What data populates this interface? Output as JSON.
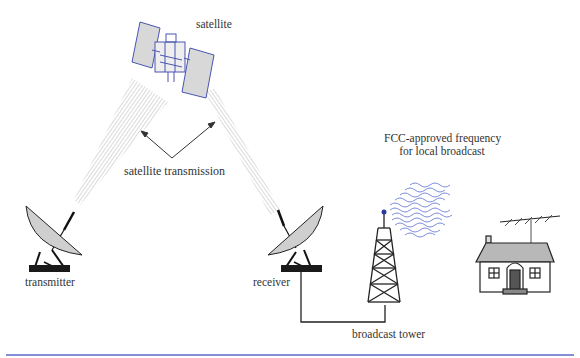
{
  "diagram": {
    "labels": {
      "satellite": "satellite",
      "satellite_transmission": "satellite transmission",
      "transmitter": "transmitter",
      "receiver": "receiver",
      "broadcast_tower": "broadcast tower",
      "fcc_line1": "FCC-approved frequency",
      "fcc_line2": "for local broadcast"
    },
    "nodes": [
      "satellite",
      "transmitter",
      "receiver",
      "broadcast tower",
      "house"
    ],
    "edges": [
      {
        "from": "transmitter",
        "to": "satellite",
        "type": "beam"
      },
      {
        "from": "satellite",
        "to": "receiver",
        "type": "beam"
      },
      {
        "from": "receiver",
        "to": "broadcast tower",
        "type": "cable"
      },
      {
        "from": "broadcast tower",
        "to": "house",
        "type": "radio waves"
      }
    ],
    "colors": {
      "satellite_outline": "#4a55b0",
      "waves": "#5a6fd0",
      "dish_fill": "#cfcfcf",
      "roof_fill": "#b8b8b8",
      "bottom_rule": "#5b6bc8"
    }
  }
}
